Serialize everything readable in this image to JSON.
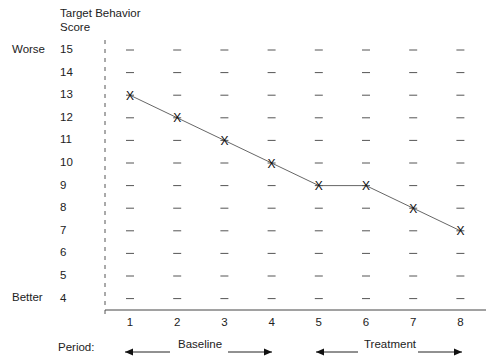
{
  "chart_data": {
    "type": "line",
    "title": "",
    "ylabel": "Target Behavior Score",
    "xlabel": "Period:",
    "y_top_label": "Worse",
    "y_bottom_label": "Better",
    "yticks": [
      15,
      14,
      13,
      12,
      11,
      10,
      9,
      8,
      7,
      6,
      5,
      4
    ],
    "ylim": [
      4,
      15
    ],
    "x": [
      1,
      2,
      3,
      4,
      5,
      6,
      7,
      8
    ],
    "series": [
      {
        "name": "Target Behavior Score",
        "marker": "X",
        "values": [
          13,
          12,
          11,
          10,
          9,
          9,
          8,
          7
        ]
      }
    ],
    "grid": "dash markers at each grid point",
    "periods": [
      {
        "label": "Baseline",
        "range": [
          1,
          4
        ]
      },
      {
        "label": "Treatment",
        "range": [
          5,
          8
        ]
      }
    ]
  },
  "labels": {
    "ylabel_line1": "Target Behavior",
    "ylabel_line2": "Score",
    "worse": "Worse",
    "better": "Better",
    "period": "Period:",
    "baseline": "Baseline",
    "treatment": "Treatment",
    "marker": "X"
  }
}
